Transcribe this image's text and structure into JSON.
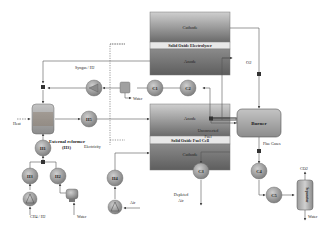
{
  "colors": {
    "cell_top": "#c8c8c8",
    "cell_bottom": "#6e6e6e",
    "component": "#9a9a9a",
    "burner": "#a8a8a8",
    "line": "#555555",
    "electrolyte_bar": "#e6e6e6"
  },
  "soe": {
    "cathode": "Cathode",
    "electrolyte": "Solid Oxide Electrolyzer",
    "anode": "Anode"
  },
  "sofc": {
    "anode": "Anode",
    "electrolyte": "Solid Oxide Fuel Cell",
    "cathode": "Cathode"
  },
  "reformer": {
    "label": "External reformer",
    "sub": "(H3)"
  },
  "burner": {
    "label": "Burner"
  },
  "separator": {
    "label": "Separator"
  },
  "components": {
    "h1": "H1",
    "h2": "H2",
    "h3": "H3",
    "h4": "H4",
    "h5": "H5",
    "c1": "C1",
    "c2": "C2",
    "c3": "C3",
    "c4": "C4",
    "c5": "C5"
  },
  "streams": {
    "syngas": "Syngas / H2",
    "water_out": "Water",
    "heat": "Heat",
    "electricity": "Electricity",
    "unconverted_fuel_1": "Unconverted",
    "unconverted_fuel_2": "Fuel",
    "o2": "O2",
    "flue_gases": "Flue Gases",
    "co2": "CO2",
    "water_sep": "Water",
    "ch4_h2": "CH4 / H2",
    "water_in": "Water",
    "air": "Air",
    "depleted_air_1": "Depleted",
    "depleted_air_2": "Air"
  }
}
